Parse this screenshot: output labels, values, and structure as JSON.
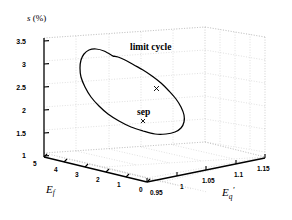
{
  "figure": {
    "width": 292,
    "height": 220,
    "background": "#ffffff",
    "line_color": "#000000",
    "grid_color": "#c8c8c8",
    "axis_color": "#000000"
  },
  "chart_data": {
    "type": "line",
    "projection": "3d",
    "title": "",
    "subtitle": "",
    "xlabel": "E'q",
    "ylabel": "Ef",
    "zlabel": "s (%)",
    "zlabel_display": "s (%)",
    "xlabel_base": "E",
    "xlabel_sub": "q",
    "xlabel_prime": "'",
    "ylabel_base": "E",
    "ylabel_sub": "f",
    "grid": true,
    "legend": "none",
    "xticks": [
      "0.95",
      "1",
      "1.05",
      "1.1",
      "1.15"
    ],
    "xtick_values": [
      0.95,
      1.0,
      1.05,
      1.1,
      1.15
    ],
    "xlim": [
      0.95,
      1.15
    ],
    "yticks": [
      "5",
      "4",
      "3",
      "2",
      "1",
      "0"
    ],
    "ytick_values": [
      5,
      4,
      3,
      2,
      1,
      0
    ],
    "ylim": [
      0,
      5
    ],
    "zticks": [
      "1",
      "1.5",
      "2",
      "2.5",
      "3",
      "3.5"
    ],
    "ztick_values": [
      1,
      1.5,
      2,
      2.5,
      3,
      3.5
    ],
    "zlim": [
      1,
      3.5
    ],
    "annotations": [
      {
        "text": "limit cycle",
        "x": 1.06,
        "y": 2.2,
        "z": 3.35
      },
      {
        "text": "sep",
        "x": 1.04,
        "y": 1.6,
        "z": 1.75
      }
    ],
    "markers": [
      {
        "name": "sep-marker",
        "symbol": "x",
        "x": 1.04,
        "y": 1.6,
        "z": 1.65
      },
      {
        "name": "curve-marker",
        "symbol": "x",
        "x": 1.075,
        "y": 2.4,
        "z": 2.55
      }
    ],
    "series": [
      {
        "name": "limit cycle",
        "style": "solid",
        "closed": true,
        "points_px": [
          [
            113,
            56
          ],
          [
            104,
            51
          ],
          [
            96,
            49
          ],
          [
            89,
            50
          ],
          [
            84,
            54
          ],
          [
            81,
            60
          ],
          [
            80,
            68
          ],
          [
            81,
            77
          ],
          [
            85,
            87
          ],
          [
            91,
            97
          ],
          [
            99,
            106
          ],
          [
            108,
            114
          ],
          [
            119,
            121
          ],
          [
            131,
            127
          ],
          [
            143,
            131
          ],
          [
            155,
            134
          ],
          [
            166,
            134
          ],
          [
            175,
            132
          ],
          [
            181,
            128
          ],
          [
            184,
            122
          ],
          [
            184,
            115
          ],
          [
            181,
            107
          ],
          [
            176,
            99
          ],
          [
            169,
            91
          ],
          [
            161,
            83
          ],
          [
            152,
            76
          ],
          [
            143,
            70
          ],
          [
            134,
            65
          ],
          [
            125,
            60
          ],
          [
            118,
            57
          ],
          [
            113,
            56
          ]
        ]
      }
    ]
  },
  "geometry": {
    "note": "3D box corner pixel coordinates",
    "origin_front": [
      147,
      182
    ],
    "left_front": [
      44,
      157
    ],
    "right_front": [
      265,
      158
    ],
    "back_top": [
      205,
      27
    ],
    "left_top": [
      44,
      38
    ],
    "right_top": [
      265,
      37
    ]
  },
  "ticks": {
    "z": [
      {
        "label": "3.5",
        "px": [
          26,
          42
        ]
      },
      {
        "label": "3",
        "px": [
          31,
          65
        ]
      },
      {
        "label": "2.5",
        "px": [
          26,
          88
        ]
      },
      {
        "label": "2",
        "px": [
          31,
          111
        ]
      },
      {
        "label": "1.5",
        "px": [
          26,
          134
        ]
      },
      {
        "label": "1",
        "px": [
          31,
          153
        ]
      }
    ],
    "y": [
      {
        "label": "5",
        "px": [
          36,
          163
        ]
      },
      {
        "label": "4",
        "px": [
          57,
          170
        ]
      },
      {
        "label": "3",
        "px": [
          78,
          176
        ]
      },
      {
        "label": "2",
        "px": [
          99,
          181
        ]
      },
      {
        "label": "1",
        "px": [
          120,
          187
        ]
      },
      {
        "label": "0",
        "px": [
          141,
          192
        ]
      }
    ],
    "x": [
      {
        "label": "0.95",
        "px": [
          152,
          194
        ]
      },
      {
        "label": "1",
        "px": [
          182,
          190
        ]
      },
      {
        "label": "1.05",
        "px": [
          205,
          185
        ]
      },
      {
        "label": "1.1",
        "px": [
          236,
          181
        ]
      },
      {
        "label": "1.15",
        "px": [
          258,
          176
        ]
      }
    ]
  },
  "labels": {
    "z_axis": "s (%)",
    "z_axis_italic": "s",
    "z_axis_rest": " (%)",
    "y_axis": "Ef",
    "x_axis": "E'q",
    "limit_cycle": "limit cycle",
    "sep": "sep"
  }
}
